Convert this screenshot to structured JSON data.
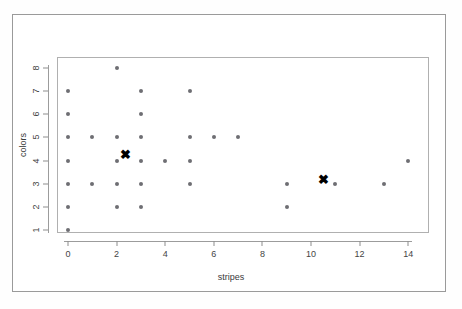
{
  "chart_data": {
    "type": "scatter",
    "title": "",
    "xlabel": "stripes",
    "ylabel": "colors",
    "xlim": [
      -0.6,
      14.8
    ],
    "ylim": [
      0.6,
      8.3
    ],
    "xticks": [
      0,
      2,
      4,
      6,
      8,
      10,
      12,
      14
    ],
    "yticks": [
      1,
      2,
      3,
      4,
      5,
      6,
      7,
      8
    ],
    "grid": false,
    "legend": null,
    "series": [
      {
        "name": "observations",
        "marker": "circle",
        "color": "#6e6e73",
        "points": [
          {
            "x": 0,
            "y": 1
          },
          {
            "x": 0,
            "y": 2
          },
          {
            "x": 0,
            "y": 3
          },
          {
            "x": 0,
            "y": 4
          },
          {
            "x": 0,
            "y": 5
          },
          {
            "x": 0,
            "y": 6
          },
          {
            "x": 0,
            "y": 7
          },
          {
            "x": 1,
            "y": 3
          },
          {
            "x": 1,
            "y": 5
          },
          {
            "x": 2,
            "y": 2
          },
          {
            "x": 2,
            "y": 3
          },
          {
            "x": 2,
            "y": 4
          },
          {
            "x": 2,
            "y": 5
          },
          {
            "x": 2,
            "y": 8
          },
          {
            "x": 3,
            "y": 2
          },
          {
            "x": 3,
            "y": 3
          },
          {
            "x": 3,
            "y": 4
          },
          {
            "x": 3,
            "y": 5
          },
          {
            "x": 3,
            "y": 6
          },
          {
            "x": 3,
            "y": 7
          },
          {
            "x": 4,
            "y": 4
          },
          {
            "x": 5,
            "y": 3
          },
          {
            "x": 5,
            "y": 4
          },
          {
            "x": 5,
            "y": 5
          },
          {
            "x": 5,
            "y": 7
          },
          {
            "x": 6,
            "y": 5
          },
          {
            "x": 7,
            "y": 5
          },
          {
            "x": 9,
            "y": 2
          },
          {
            "x": 9,
            "y": 3
          },
          {
            "x": 11,
            "y": 3
          },
          {
            "x": 13,
            "y": 3
          },
          {
            "x": 14,
            "y": 4
          }
        ]
      },
      {
        "name": "cluster centers",
        "marker": "x",
        "glyph": "✖",
        "color": "#000000",
        "points": [
          {
            "x": 2.35,
            "y": 4.3
          },
          {
            "x": 10.5,
            "y": 3.2
          }
        ]
      }
    ]
  },
  "axes": {
    "x_label": "stripes",
    "y_label": "colors",
    "x_tick_labels": [
      "0",
      "2",
      "4",
      "6",
      "8",
      "10",
      "12",
      "14"
    ],
    "y_tick_labels": [
      "1",
      "2",
      "3",
      "4",
      "5",
      "6",
      "7",
      "8"
    ]
  },
  "colors": {
    "point": "#6e6e73",
    "centroid": "#000000",
    "axis": "#9c9c9c",
    "plot_border": "#b0b0b0",
    "page_border": "#9a9a9a",
    "background": "#ffffff"
  }
}
